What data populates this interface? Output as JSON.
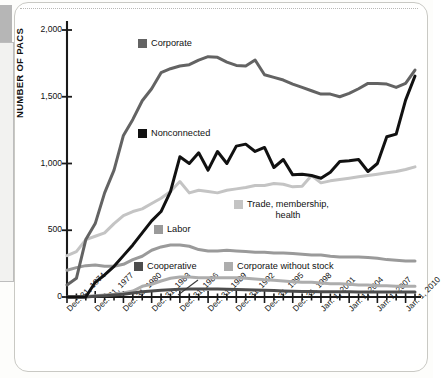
{
  "page": {
    "border_color": "#c9c9c4",
    "left_tab_color": "#b6b6b6"
  },
  "chart_data": {
    "type": "line",
    "title": "",
    "xlabel": "",
    "ylabel": "NUMBER OF PACS",
    "ylim": [
      0,
      2000
    ],
    "yticks": [
      0,
      500,
      1000,
      1500,
      2000
    ],
    "ytick_labels": [
      "0",
      "500",
      "1,000",
      "1,500",
      "2,000"
    ],
    "grid": false,
    "legend_position": "inline-annotations",
    "x_start_year": 1974,
    "x_end_year": 2011,
    "xtick_labels": [
      "Dec. 31, 1974",
      "Dec. 31, 1977",
      "Dec. 31, 1980",
      "Dec. 31, 1983",
      "Dec. 31, 1986",
      "Dec. 31, 1989",
      "Dec. 31, 1992",
      "Dec. 31, 1995",
      "Dec. 31, 1998",
      "Jan. 1, 2001",
      "Jan. 1, 2004",
      "Jan. 1, 2007",
      "Jan. 1, 2010"
    ],
    "xtick_years": [
      1974,
      1977,
      1980,
      1983,
      1986,
      1989,
      1992,
      1995,
      1998,
      2001,
      2004,
      2007,
      2010
    ],
    "x": [
      1974,
      1975,
      1976,
      1977,
      1978,
      1979,
      1980,
      1981,
      1982,
      1983,
      1984,
      1985,
      1986,
      1987,
      1988,
      1989,
      1990,
      1991,
      1992,
      1993,
      1994,
      1995,
      1996,
      1997,
      1998,
      1999,
      2000,
      2001,
      2002,
      2003,
      2004,
      2005,
      2006,
      2007,
      2008,
      2009,
      2010,
      2011
    ],
    "series": [
      {
        "name": "Corporate",
        "color": "#636363",
        "label": "Corporate",
        "values": [
          90,
          140,
          430,
          550,
          780,
          950,
          1210,
          1330,
          1470,
          1560,
          1680,
          1710,
          1730,
          1740,
          1775,
          1800,
          1795,
          1760,
          1735,
          1730,
          1775,
          1665,
          1645,
          1625,
          1595,
          1570,
          1545,
          1520,
          1520,
          1500,
          1525,
          1560,
          1600,
          1600,
          1595,
          1570,
          1600,
          1700
        ]
      },
      {
        "name": "Nonconnected",
        "color": "#111111",
        "label": "Nonconnected",
        "values": [
          0,
          0,
          0,
          110,
          165,
          230,
          310,
          390,
          480,
          570,
          640,
          790,
          1050,
          1000,
          1080,
          950,
          1090,
          1000,
          1130,
          1145,
          1090,
          1120,
          970,
          1030,
          915,
          920,
          910,
          890,
          935,
          1015,
          1020,
          1030,
          940,
          1000,
          1200,
          1220,
          1475,
          1655
        ]
      },
      {
        "name": "Trade, membership, health",
        "color": "#c4c4c4",
        "label": "Trade, membership,\nhealth",
        "values": [
          310,
          340,
          430,
          455,
          480,
          550,
          610,
          640,
          660,
          700,
          740,
          790,
          865,
          780,
          800,
          790,
          780,
          800,
          810,
          820,
          835,
          835,
          850,
          845,
          825,
          830,
          910,
          855,
          870,
          880,
          890,
          900,
          910,
          920,
          930,
          940,
          955,
          975
        ]
      },
      {
        "name": "Labor",
        "color": "#9a9a9a",
        "label": "Labor",
        "values": [
          200,
          220,
          235,
          240,
          230,
          230,
          245,
          280,
          305,
          350,
          375,
          390,
          390,
          380,
          355,
          345,
          345,
          350,
          345,
          340,
          335,
          335,
          330,
          330,
          325,
          320,
          315,
          315,
          305,
          300,
          300,
          300,
          295,
          290,
          280,
          275,
          270,
          270
        ]
      },
      {
        "name": "Corporate without stock",
        "color": "#adadad",
        "label": "Corporate without stock",
        "values": [
          0,
          0,
          5,
          10,
          15,
          20,
          30,
          45,
          80,
          95,
          120,
          140,
          150,
          150,
          145,
          145,
          145,
          145,
          145,
          140,
          135,
          130,
          125,
          120,
          115,
          110,
          110,
          105,
          100,
          100,
          95,
          90,
          90,
          85,
          85,
          80,
          80,
          80
        ]
      },
      {
        "name": "Cooperative",
        "color": "#4d4d4d",
        "label": "Cooperative",
        "values": [
          0,
          0,
          0,
          5,
          10,
          15,
          20,
          30,
          40,
          45,
          50,
          55,
          58,
          60,
          60,
          60,
          60,
          58,
          57,
          55,
          52,
          50,
          48,
          45,
          43,
          42,
          42,
          40,
          40,
          40,
          40,
          38,
          38,
          38,
          38,
          38,
          38,
          38
        ]
      }
    ],
    "annotations": [
      {
        "name": "cooperative-leader-line",
        "from": "Cooperative label",
        "to": "Cooperative series"
      }
    ]
  }
}
